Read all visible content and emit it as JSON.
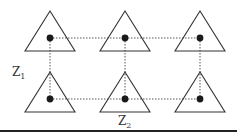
{
  "diagram": {
    "type": "lattice",
    "rows": 2,
    "columns": 3,
    "nodes": [
      {
        "id": "n-0-0",
        "row": 0,
        "col": 0,
        "shape": "triangle"
      },
      {
        "id": "n-0-1",
        "row": 0,
        "col": 1,
        "shape": "triangle"
      },
      {
        "id": "n-0-2",
        "row": 0,
        "col": 2,
        "shape": "triangle"
      },
      {
        "id": "n-1-0",
        "row": 1,
        "col": 0,
        "shape": "triangle"
      },
      {
        "id": "n-1-1",
        "row": 1,
        "col": 1,
        "shape": "triangle"
      },
      {
        "id": "n-1-2",
        "row": 1,
        "col": 2,
        "shape": "triangle"
      }
    ],
    "edges": [
      {
        "from": "n-0-0",
        "to": "n-0-1",
        "style": "dotted"
      },
      {
        "from": "n-0-1",
        "to": "n-0-2",
        "style": "dotted"
      },
      {
        "from": "n-1-0",
        "to": "n-1-1",
        "style": "dotted"
      },
      {
        "from": "n-1-1",
        "to": "n-1-2",
        "style": "dotted"
      },
      {
        "from": "n-0-0",
        "to": "n-1-0",
        "style": "dotted"
      },
      {
        "from": "n-0-1",
        "to": "n-1-1",
        "style": "dotted"
      },
      {
        "from": "n-0-2",
        "to": "n-1-2",
        "style": "dotted"
      }
    ],
    "labels": {
      "vertical_axis": {
        "base": "Z",
        "subscript": "1"
      },
      "horizontal_axis": {
        "base": "Z",
        "subscript": "2"
      }
    },
    "colors": {
      "stroke": "#333333",
      "dot": "#1a1a1a",
      "background": "#ffffff"
    }
  }
}
